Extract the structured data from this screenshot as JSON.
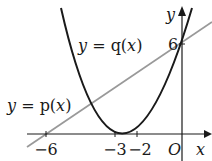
{
  "diagram": {
    "type": "function-graph",
    "axes": {
      "x_label": "x",
      "y_label": "y",
      "origin_label": "O"
    },
    "x_ticks": [
      {
        "value": -6,
        "label": "−6"
      },
      {
        "value": -3,
        "label": "−3"
      },
      {
        "value": -2,
        "label": "−2"
      }
    ],
    "y_ticks": [
      {
        "value": 6,
        "label": "6"
      }
    ],
    "curves": [
      {
        "name": "q",
        "label": "y = q(x)",
        "kind": "parabola",
        "roots": [
          -3,
          -2
        ],
        "y_intercept": 6,
        "color": "#1a1a1a"
      },
      {
        "name": "p",
        "label": "y = p(x)",
        "kind": "line",
        "root": -6,
        "y_intercept": 6,
        "color": "#999999"
      }
    ],
    "labels": {
      "q_prefix": "y",
      "q_eq": " = q(",
      "q_var": "x",
      "q_close": ")",
      "p_prefix": "y",
      "p_eq": " = p(",
      "p_var": "x",
      "p_close": ")"
    }
  }
}
